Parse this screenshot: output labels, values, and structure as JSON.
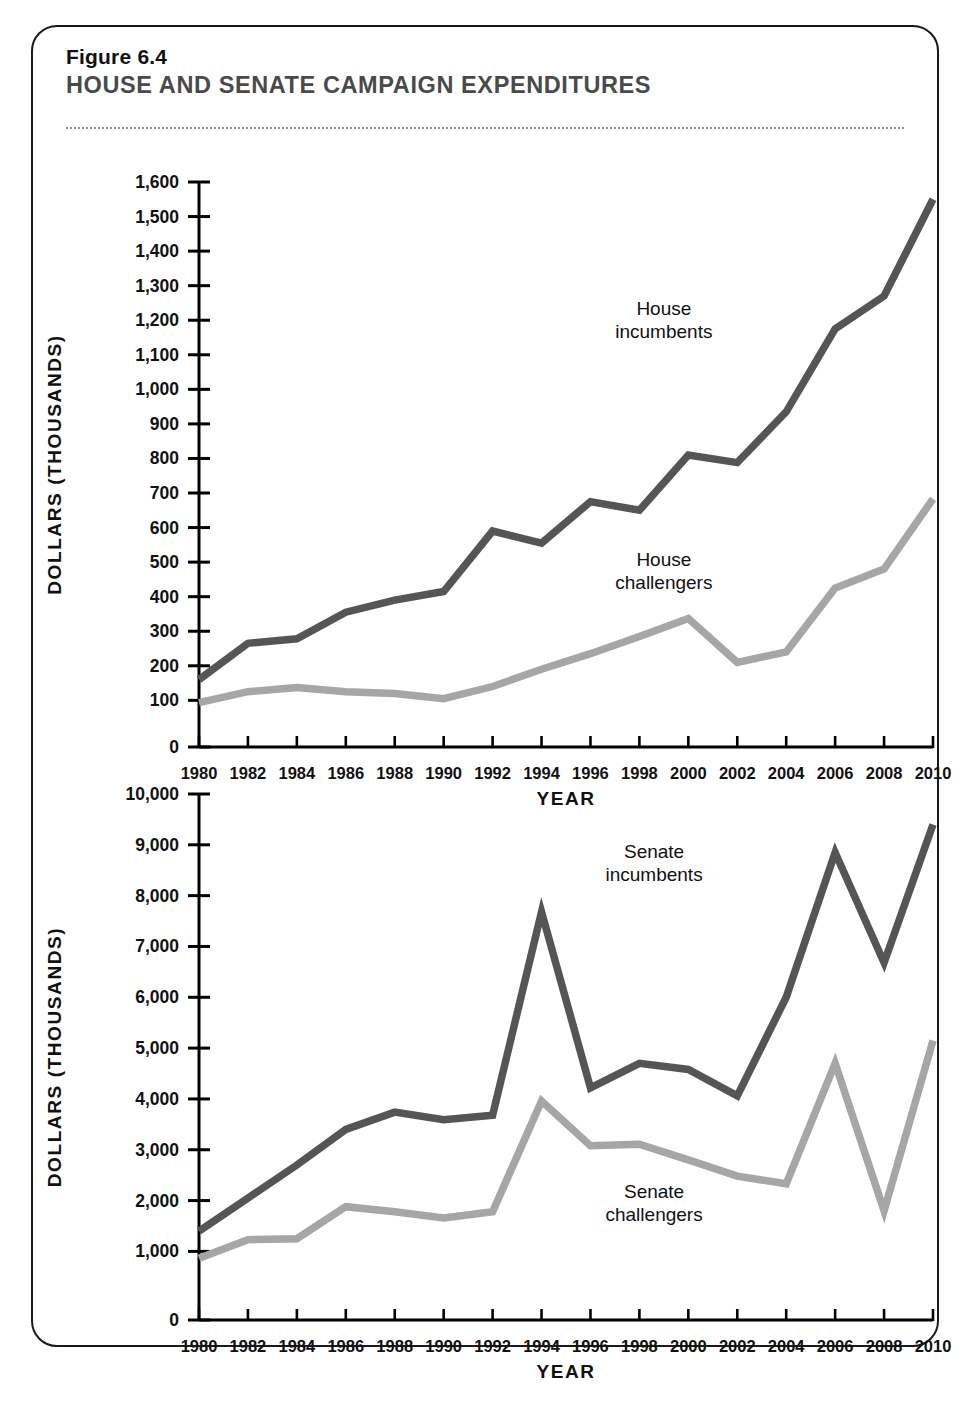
{
  "figure": {
    "number": "Figure 6.4",
    "title": "HOUSE AND SENATE CAMPAIGN EXPENDITURES"
  },
  "colors": {
    "incumbent_line": "#555555",
    "challenger_line": "#a6a6a6",
    "axis": "#000000",
    "title_gray": "#4a4a4a"
  },
  "chart_data": [
    {
      "id": "house",
      "type": "line",
      "title": "House campaign expenditures",
      "xlabel": "YEAR",
      "ylabel": "DOLLARS (THOUSANDS)",
      "x": [
        1980,
        1982,
        1984,
        1986,
        1988,
        1990,
        1992,
        1994,
        1996,
        1998,
        2000,
        2002,
        2004,
        2006,
        2008,
        2010
      ],
      "xtick_labels": [
        "1980",
        "1982",
        "1984",
        "1986",
        "1988",
        "1990",
        "1992",
        "1994",
        "1996",
        "1998",
        "2000",
        "2002",
        "2004",
        "2006",
        "2008",
        "2010"
      ],
      "ytick_labels": [
        "0",
        "100",
        "200",
        "300",
        "400",
        "500",
        "600",
        "700",
        "800",
        "900",
        "1,000",
        "1,100",
        "1,200",
        "1,300",
        "1,400",
        "1,500",
        "1,600"
      ],
      "ytick_values": [
        0,
        100,
        200,
        300,
        400,
        500,
        600,
        700,
        800,
        900,
        1000,
        1100,
        1200,
        1300,
        1400,
        1500,
        1600
      ],
      "ylim": [
        0,
        1600
      ],
      "grid": false,
      "legend": "inline-annotations",
      "series": [
        {
          "name": "House incumbents",
          "color": "#555555",
          "label_x": 1999.0,
          "label_y": 1215,
          "values": [
            160,
            265,
            278,
            355,
            390,
            415,
            590,
            555,
            675,
            650,
            810,
            788,
            935,
            1175,
            1270,
            1550
          ]
        },
        {
          "name": "House challengers",
          "color": "#a6a6a6",
          "label_x": 1999.0,
          "label_y": 490,
          "values": [
            95,
            125,
            137,
            125,
            120,
            105,
            140,
            190,
            235,
            285,
            337,
            210,
            240,
            425,
            480,
            683
          ]
        }
      ]
    },
    {
      "id": "senate",
      "type": "line",
      "title": "Senate campaign expenditures",
      "xlabel": "YEAR",
      "ylabel": "DOLLARS (THOUSANDS)",
      "x": [
        1980,
        1982,
        1984,
        1986,
        1988,
        1990,
        1992,
        1994,
        1996,
        1998,
        2000,
        2002,
        2004,
        2006,
        2008,
        2010
      ],
      "xtick_labels": [
        "1980",
        "1982",
        "1984",
        "1986",
        "1988",
        "1990",
        "1992",
        "1994",
        "1996",
        "1998",
        "2000",
        "2002",
        "2004",
        "2006",
        "2008",
        "2010"
      ],
      "ytick_labels": [
        "0",
        "1,000",
        "2,000",
        "3,000",
        "4,000",
        "5,000",
        "6,000",
        "7,000",
        "8,000",
        "9,000",
        "10,000"
      ],
      "ytick_values": [
        0,
        1000,
        2000,
        3000,
        4000,
        5000,
        6000,
        7000,
        8000,
        9000,
        10000
      ],
      "ylim": [
        0,
        10000
      ],
      "grid": false,
      "legend": "inline-annotations",
      "series": [
        {
          "name": "Senate incumbents",
          "color": "#555555",
          "label_x": 1998.6,
          "label_y": 8750,
          "values": [
            1400,
            2050,
            2700,
            3400,
            3740,
            3590,
            3680,
            7680,
            4220,
            4700,
            4580,
            4060,
            6000,
            8850,
            6680,
            9400
          ]
        },
        {
          "name": "Senate challengers",
          "color": "#a6a6a6",
          "label_x": 1998.6,
          "label_y": 2050,
          "values": [
            900,
            1230,
            1250,
            1880,
            1780,
            1660,
            1780,
            3960,
            3080,
            3110,
            2800,
            2480,
            2330,
            4700,
            1800,
            5150
          ]
        }
      ]
    }
  ]
}
